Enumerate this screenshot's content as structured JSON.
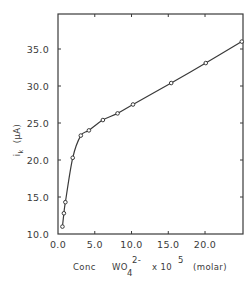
{
  "chart_data": {
    "type": "line",
    "title": "",
    "xlabel": "Conc WO4 2- x 10^5 (molar)",
    "ylabel": "i_k (μA)",
    "xlabel_parts": {
      "prefix": "Conc",
      "species": "WO",
      "subscript": "4",
      "superscript": "2-",
      "multiplier": "x 10",
      "exponent": "5",
      "unit": "(molar)"
    },
    "ylabel_parts": {
      "symbol": "i",
      "subscript": "k",
      "unit": "(μA)"
    },
    "xlim": [
      0,
      25
    ],
    "ylim": [
      10,
      39.5
    ],
    "x_ticks": [
      0,
      5,
      10,
      15,
      20
    ],
    "x_tick_labels": [
      "0.0",
      "5.0",
      "10.0",
      "15.0",
      "20.0"
    ],
    "y_ticks": [
      10,
      15,
      20,
      25,
      30,
      35
    ],
    "y_tick_labels": [
      "10.0",
      "15.0",
      "20.0",
      "25.0",
      "30.0",
      "35.0"
    ],
    "grid": false,
    "legend": null,
    "series": [
      {
        "name": "i_k vs [WO4 2-]",
        "marker": "open-circle",
        "x": [
          0.6,
          0.8,
          1.0,
          2.0,
          3.1,
          4.2,
          6.1,
          8.1,
          10.2,
          15.4,
          20.1,
          25.0
        ],
        "y": [
          11.0,
          12.8,
          14.3,
          20.3,
          23.3,
          24.0,
          25.4,
          26.3,
          27.5,
          30.4,
          33.1,
          36.0
        ]
      }
    ]
  },
  "colors": {
    "ink": "#3a3a3a",
    "background": "#ffffff"
  }
}
